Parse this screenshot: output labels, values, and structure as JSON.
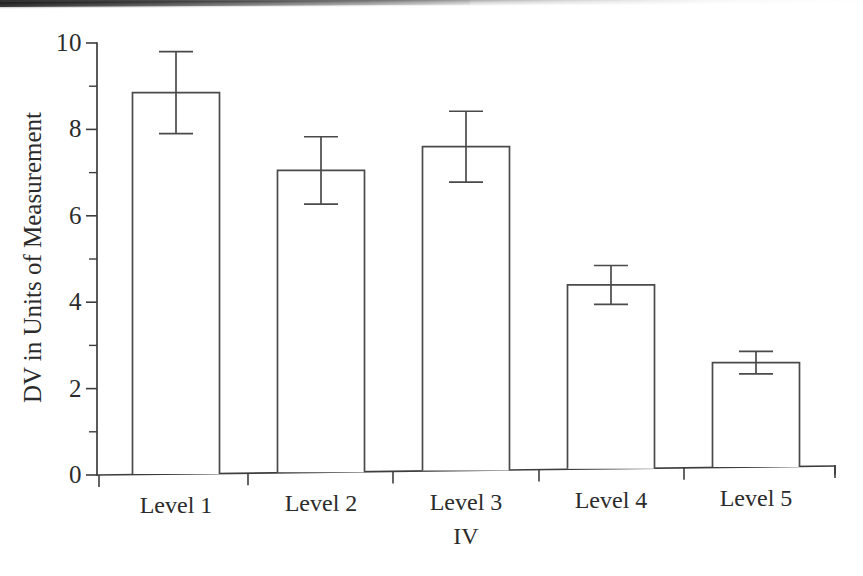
{
  "figure": {
    "background_color": "#ffffff",
    "ink_color": "#3d3d3d",
    "scan_artifact": "top-edge-dark-band"
  },
  "chart_data": {
    "type": "bar",
    "title": "",
    "xlabel": "IV",
    "ylabel": "DV in Units of Measurement",
    "categories": [
      "Level 1",
      "Level 2",
      "Level 3",
      "Level 4",
      "Level 5"
    ],
    "values": [
      8.85,
      7.05,
      7.6,
      4.4,
      2.6
    ],
    "errors": [
      0.95,
      0.78,
      0.82,
      0.45,
      0.26
    ],
    "error_bar_style": "capped-vertical",
    "bar_style": "unfilled-outline",
    "ylim": [
      0,
      10
    ],
    "ytick_labels": [
      "0",
      "2",
      "4",
      "6",
      "8",
      "10"
    ],
    "ytick_values": [
      0,
      2,
      4,
      6,
      8,
      10
    ],
    "yminor_tick_values": [
      1,
      3,
      5,
      7,
      9
    ],
    "grid": false,
    "legend": false
  }
}
